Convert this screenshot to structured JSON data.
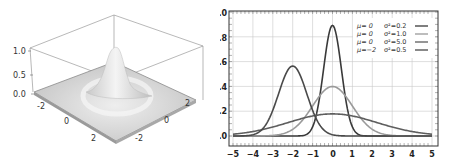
{
  "chart_data": [
    {
      "type": "surface",
      "title": "",
      "description": "3D surface of a bivariate normal density (peak at origin)",
      "z_ticks": [
        "0.0",
        "0.5",
        "1.0"
      ],
      "x_ticks": [
        "-2",
        "0",
        "2"
      ],
      "y_ticks": [
        "-2",
        "0",
        "2"
      ],
      "zlim": [
        0,
        1
      ],
      "peak": {
        "x": 0,
        "y": 0,
        "z": 1.0
      }
    },
    {
      "type": "line",
      "title": "",
      "xlabel": "",
      "ylabel": "",
      "xlim": [
        -5,
        5
      ],
      "ylim": [
        0,
        1.0
      ],
      "grid": true,
      "x_ticks": [
        "−5",
        "−4",
        "−3",
        "−2",
        "−1",
        "0",
        "1",
        "2",
        "3",
        "4",
        "5"
      ],
      "y_ticks": [
        "0.0",
        "0.2",
        "0.4",
        "0.6",
        "0.8",
        "1.0"
      ],
      "legend_position": "upper right",
      "series": [
        {
          "name": "μ= 0  σ²=0.2",
          "mu_label": "μ=  0",
          "var_label": "σ²=0.2",
          "mu": 0,
          "variance": 0.2,
          "color": "#3a3a3a",
          "peak": 0.89
        },
        {
          "name": "μ= 0  σ²=1.0",
          "mu_label": "μ=  0",
          "var_label": "σ²=1.0",
          "mu": 0,
          "variance": 1.0,
          "color": "#9a9a9a",
          "peak": 0.4
        },
        {
          "name": "μ= 0  σ²=5.0",
          "mu_label": "μ=  0",
          "var_label": "σ²=5.0",
          "mu": 0,
          "variance": 5.0,
          "color": "#5e5e5e",
          "peak": 0.18
        },
        {
          "name": "μ=−2  σ²=0.5",
          "mu_label": "μ=−2",
          "var_label": "σ²=0.5",
          "mu": -2,
          "variance": 0.5,
          "color": "#4a4a4a",
          "peak": 0.56
        }
      ]
    }
  ]
}
